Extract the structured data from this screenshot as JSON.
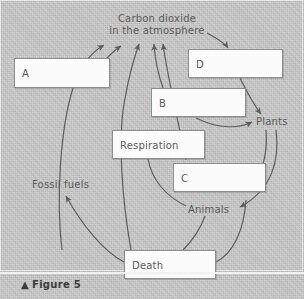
{
  "figure": {
    "caption_marker": "▲",
    "caption_text": "Figure 5",
    "background_color": "#c8c8c8",
    "line_color": "#5d5d5d",
    "box_fill": "#fbfbfb",
    "box_border": "#8e8e8e",
    "text_color": "#5a5a5a"
  },
  "diagram": {
    "type": "carbon-cycle-flow-diagram",
    "pool_label": {
      "name": "carbon-dioxide-in-atmosphere",
      "line1": "Carbon dioxide",
      "line2": "in the atmosphere"
    },
    "boxes": [
      {
        "id": "A",
        "label": "A",
        "x": 14,
        "y": 58,
        "w": 96,
        "h": 30
      },
      {
        "id": "D",
        "label": "D",
        "x": 188,
        "y": 49,
        "w": 95,
        "h": 29
      },
      {
        "id": "B",
        "label": "B",
        "x": 151,
        "y": 88,
        "w": 95,
        "h": 29
      },
      {
        "id": "Respiration",
        "label": "Respiration",
        "x": 112,
        "y": 130,
        "w": 93,
        "h": 29
      },
      {
        "id": "C",
        "label": "C",
        "x": 173,
        "y": 163,
        "w": 93,
        "h": 29
      },
      {
        "id": "Death",
        "label": "Death",
        "x": 124,
        "y": 250,
        "w": 92,
        "h": 29
      }
    ],
    "free_labels": [
      {
        "id": "plants",
        "label": "Plants",
        "x": 256,
        "y": 116
      },
      {
        "id": "animals",
        "label": "Animals",
        "x": 188,
        "y": 204
      },
      {
        "id": "fossil-fuels",
        "label": "Fossil fuels",
        "x": 32,
        "y": 179
      }
    ]
  }
}
